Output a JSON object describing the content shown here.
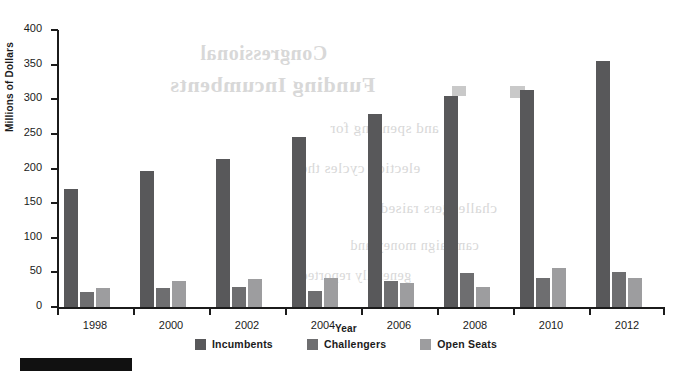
{
  "chart_data": {
    "type": "bar",
    "title": "",
    "xlabel": "Year",
    "ylabel": "Millions of Dollars",
    "categories": [
      "1998",
      "2000",
      "2002",
      "2004",
      "2006",
      "2008",
      "2010",
      "2012"
    ],
    "ylim": [
      0,
      400
    ],
    "yticks": [
      0,
      50,
      100,
      150,
      200,
      250,
      300,
      350,
      400
    ],
    "ytick_labels": [
      "0",
      "50",
      "100",
      "150",
      "200",
      "250",
      "300",
      "350",
      "400"
    ],
    "grid": false,
    "legend_position": "bottom",
    "series": [
      {
        "name": "Incumbents",
        "color": "#58585a",
        "values": [
          170,
          196,
          214,
          246,
          279,
          305,
          314,
          355
        ]
      },
      {
        "name": "Challengers",
        "color": "#6e6e70",
        "values": [
          22,
          27,
          29,
          23,
          37,
          49,
          42,
          51
        ]
      },
      {
        "name": "Open Seats",
        "color": "#9d9d9f",
        "values": [
          27,
          37,
          40,
          42,
          34,
          29,
          56,
          42
        ]
      }
    ]
  },
  "bleed_through": {
    "line1": "Congressional",
    "line2": "Funding Incumbents",
    "line3": "and spending for",
    "line4": "election cycles the",
    "line5": "challengers raised",
    "line6": "campaign money and",
    "line7": "generally reported"
  }
}
